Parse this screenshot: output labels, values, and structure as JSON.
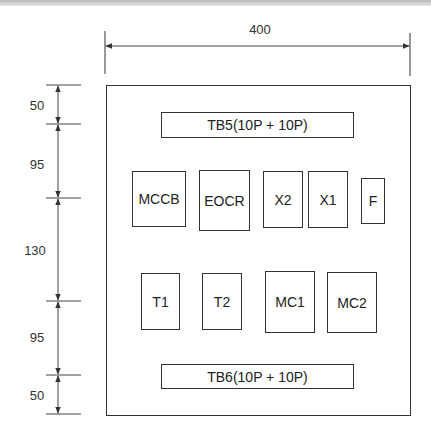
{
  "diagram": {
    "type": "panel layout drawing",
    "width_dimension": "400",
    "height_dimensions": [
      "50",
      "95",
      "130",
      "95",
      "50"
    ],
    "components": {
      "tb5": "TB5(10P + 10P)",
      "mccb": "MCCB",
      "eocr": "EOCR",
      "x2": "X2",
      "x1": "X1",
      "f": "F",
      "t1": "T1",
      "t2": "T2",
      "mc1": "MC1",
      "mc2": "MC2",
      "tb6": "TB6(10P + 10P)"
    },
    "rows": [
      [
        "TB5(10P + 10P)"
      ],
      [
        "MCCB",
        "EOCR",
        "X2",
        "X1",
        "F"
      ],
      [
        "T1",
        "T2",
        "MC1",
        "MC2"
      ],
      [
        "TB6(10P + 10P)"
      ]
    ],
    "colors": {
      "line": "#333333",
      "background": "#ffffff"
    }
  }
}
